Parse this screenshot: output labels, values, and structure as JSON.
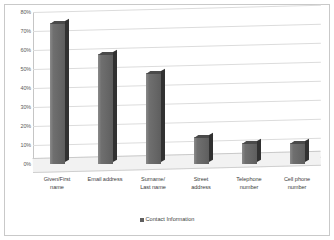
{
  "chart_data": {
    "type": "bar",
    "title": "",
    "xlabel": "",
    "ylabel": "",
    "categories": [
      "Given/First name",
      "Email address",
      "Surname/ Last name",
      "Street address",
      "Telephone number",
      "Cell phone number"
    ],
    "category_lines": [
      [
        "Given/First",
        "name"
      ],
      [
        "Email address"
      ],
      [
        "Surname/",
        "Last name"
      ],
      [
        "Street",
        "address"
      ],
      [
        "Telephone",
        "number"
      ],
      [
        "Cell phone",
        "number"
      ]
    ],
    "series": [
      {
        "name": "Contact Information",
        "values": [
          74,
          58,
          48,
          14,
          11,
          11
        ]
      }
    ],
    "ylim": [
      0,
      80
    ],
    "ytick_values": [
      0,
      10,
      20,
      30,
      40,
      50,
      60,
      70,
      80
    ],
    "ytick_labels": [
      "0%",
      "10%",
      "20%",
      "30%",
      "40%",
      "50%",
      "60%",
      "70%",
      "80%"
    ],
    "grid": true,
    "legend_position": "bottom",
    "legend_entries": [
      "Contact Information"
    ],
    "style": "3d-column",
    "colors": {
      "bar_front": "#6f6f6f",
      "bar_side": "#313131",
      "bar_top": "#4a4a4a",
      "gridline": "#dcdcdc",
      "axis": "#c5c5c5",
      "floor": "#f2f2f2",
      "border": "#c9c9c9",
      "tick_label": "#5a5a5a",
      "category_label": "#3d3d3d",
      "background": "#ffffff"
    }
  },
  "legend": {
    "label": "Contact Information",
    "marker": "square-marker"
  }
}
